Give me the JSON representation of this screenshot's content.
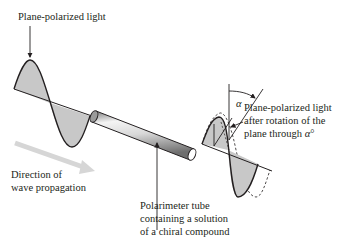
{
  "labels": {
    "incident_light": "Plane-polarized light",
    "rotated_light": {
      "line1": "Plane-polarized light",
      "line2": "after rotation of the",
      "line3_prefix": "plane through ",
      "line3_symbol": "α",
      "line3_suffix": "°"
    },
    "direction": {
      "line1": "Direction of",
      "line2": "wave propagation"
    },
    "tube": {
      "line1": "Polarimeter tube",
      "line2": "containing a solution",
      "line3": "of a chiral compound"
    },
    "angle_symbol": "α"
  },
  "colors": {
    "wave_fill": "#c8c8c8",
    "stroke": "#231f20",
    "direction_arrow": "#d4d4d4",
    "tube_light": "#f2f2f2",
    "tube_dark": "#8a8a8a"
  }
}
